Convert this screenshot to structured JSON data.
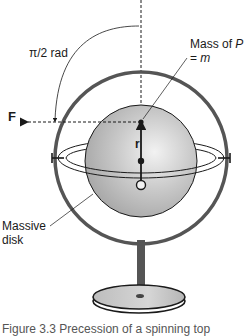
{
  "figure": {
    "labels": {
      "angle": "π/2 rad",
      "mass_line1_prefix": "Mass of ",
      "mass_line1_var": "P",
      "mass_line2_prefix": "= ",
      "mass_line2_var": "m",
      "force": "F",
      "radius": "r",
      "disk_line1": "Massive",
      "disk_line2": "disk"
    },
    "caption": "Figure 3.3  Precession of a spinning top",
    "colors": {
      "ring": "#555555",
      "sphere_light": "#ececec",
      "sphere_dark": "#a9a9a9",
      "stand": "#555555",
      "base_top": "#c4c4c4",
      "lines": "#1a1a1a"
    }
  }
}
